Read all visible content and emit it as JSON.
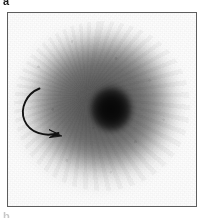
{
  "figure": {
    "panel_label": "a",
    "next_panel_label": "b",
    "modality": "grayscale-planar-scintigraphy-image",
    "frame": {
      "border_color": "#5d5d5d",
      "background_color": "#fdfdfd"
    }
  },
  "image_content": {
    "background_tone": "#fdfdfd",
    "halo_tone": "#8a8a8a",
    "midfield_tone": "#6e6e6e",
    "core_tone": "#0d0d0d",
    "description": "Diffuse elliptical region of uniform mid-gray uptake surrounding a small, dense, near-black focal core slightly right of centre."
  },
  "annotations": {
    "arrow": {
      "icon": "curved-arrow-icon",
      "stroke_color": "#121212",
      "points_to": "focal-dark-core",
      "direction": "counter-clockwise-sweep-to-lower-right"
    }
  }
}
